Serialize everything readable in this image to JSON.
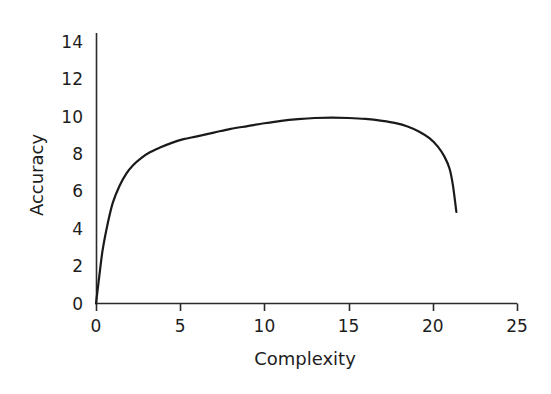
{
  "chart_data": {
    "type": "line",
    "title": "",
    "xlabel": "Complexity",
    "ylabel": "Accuracy",
    "xlim": [
      0,
      25
    ],
    "ylim": [
      0,
      14
    ],
    "xticks": [
      0,
      5,
      10,
      15,
      20,
      25
    ],
    "yticks": [
      0,
      2,
      4,
      6,
      8,
      10,
      12,
      14
    ],
    "xtick_labels": [
      "0",
      "5",
      "10",
      "15",
      "20",
      "25"
    ],
    "ytick_labels": [
      "0",
      "2",
      "4",
      "6",
      "8",
      "10",
      "12",
      "14"
    ],
    "grid": false,
    "legend": null,
    "series": [
      {
        "name": "accuracy-vs-complexity",
        "color": "#1a1a1a",
        "line_width": 2.2,
        "x": [
          0.0,
          0.2,
          0.4,
          0.7,
          1.0,
          1.4,
          1.8,
          2.2,
          2.7,
          3.2,
          3.8,
          4.5,
          5.2,
          6.0,
          7.0,
          8.0,
          9.0,
          10.0,
          11.0,
          12.0,
          13.0,
          14.0,
          15.0,
          16.0,
          17.0,
          17.8,
          18.5,
          19.2,
          19.8,
          20.3,
          20.7,
          21.0,
          21.2,
          21.4
        ],
        "y": [
          0.0,
          1.5,
          2.9,
          4.3,
          5.4,
          6.3,
          6.95,
          7.4,
          7.8,
          8.1,
          8.35,
          8.6,
          8.8,
          8.95,
          9.15,
          9.35,
          9.5,
          9.65,
          9.78,
          9.87,
          9.93,
          9.95,
          9.93,
          9.88,
          9.78,
          9.66,
          9.48,
          9.2,
          8.85,
          8.4,
          7.85,
          7.2,
          6.3,
          4.9
        ]
      }
    ],
    "annotations": []
  },
  "axes": {
    "y_axis_name": "vertical-axis-line",
    "x_axis_name": "horizontal-axis-line",
    "tick_color": "#2b2b2b"
  }
}
